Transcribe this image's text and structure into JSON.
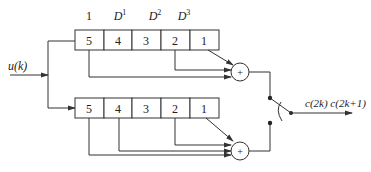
{
  "diagram": {
    "type": "convolutional-encoder",
    "input": {
      "label": "u(k)"
    },
    "delay_labels": [
      "1",
      "D",
      "D",
      "D"
    ],
    "delay_powers": [
      "",
      "1",
      "2",
      "3"
    ],
    "top_register": {
      "cells": [
        "5",
        "4",
        "3",
        "2",
        "1"
      ],
      "taps": [
        "5",
        "2",
        "1"
      ]
    },
    "bottom_register": {
      "cells": [
        "5",
        "4",
        "3",
        "2",
        "1"
      ],
      "taps": [
        "5",
        "4",
        "2",
        "1"
      ]
    },
    "adders": [
      {
        "name": "top-adder",
        "symbol": "+"
      },
      {
        "name": "bottom-adder",
        "symbol": "+"
      }
    ],
    "output": {
      "label": "c(2k) c(2k+1)"
    }
  }
}
